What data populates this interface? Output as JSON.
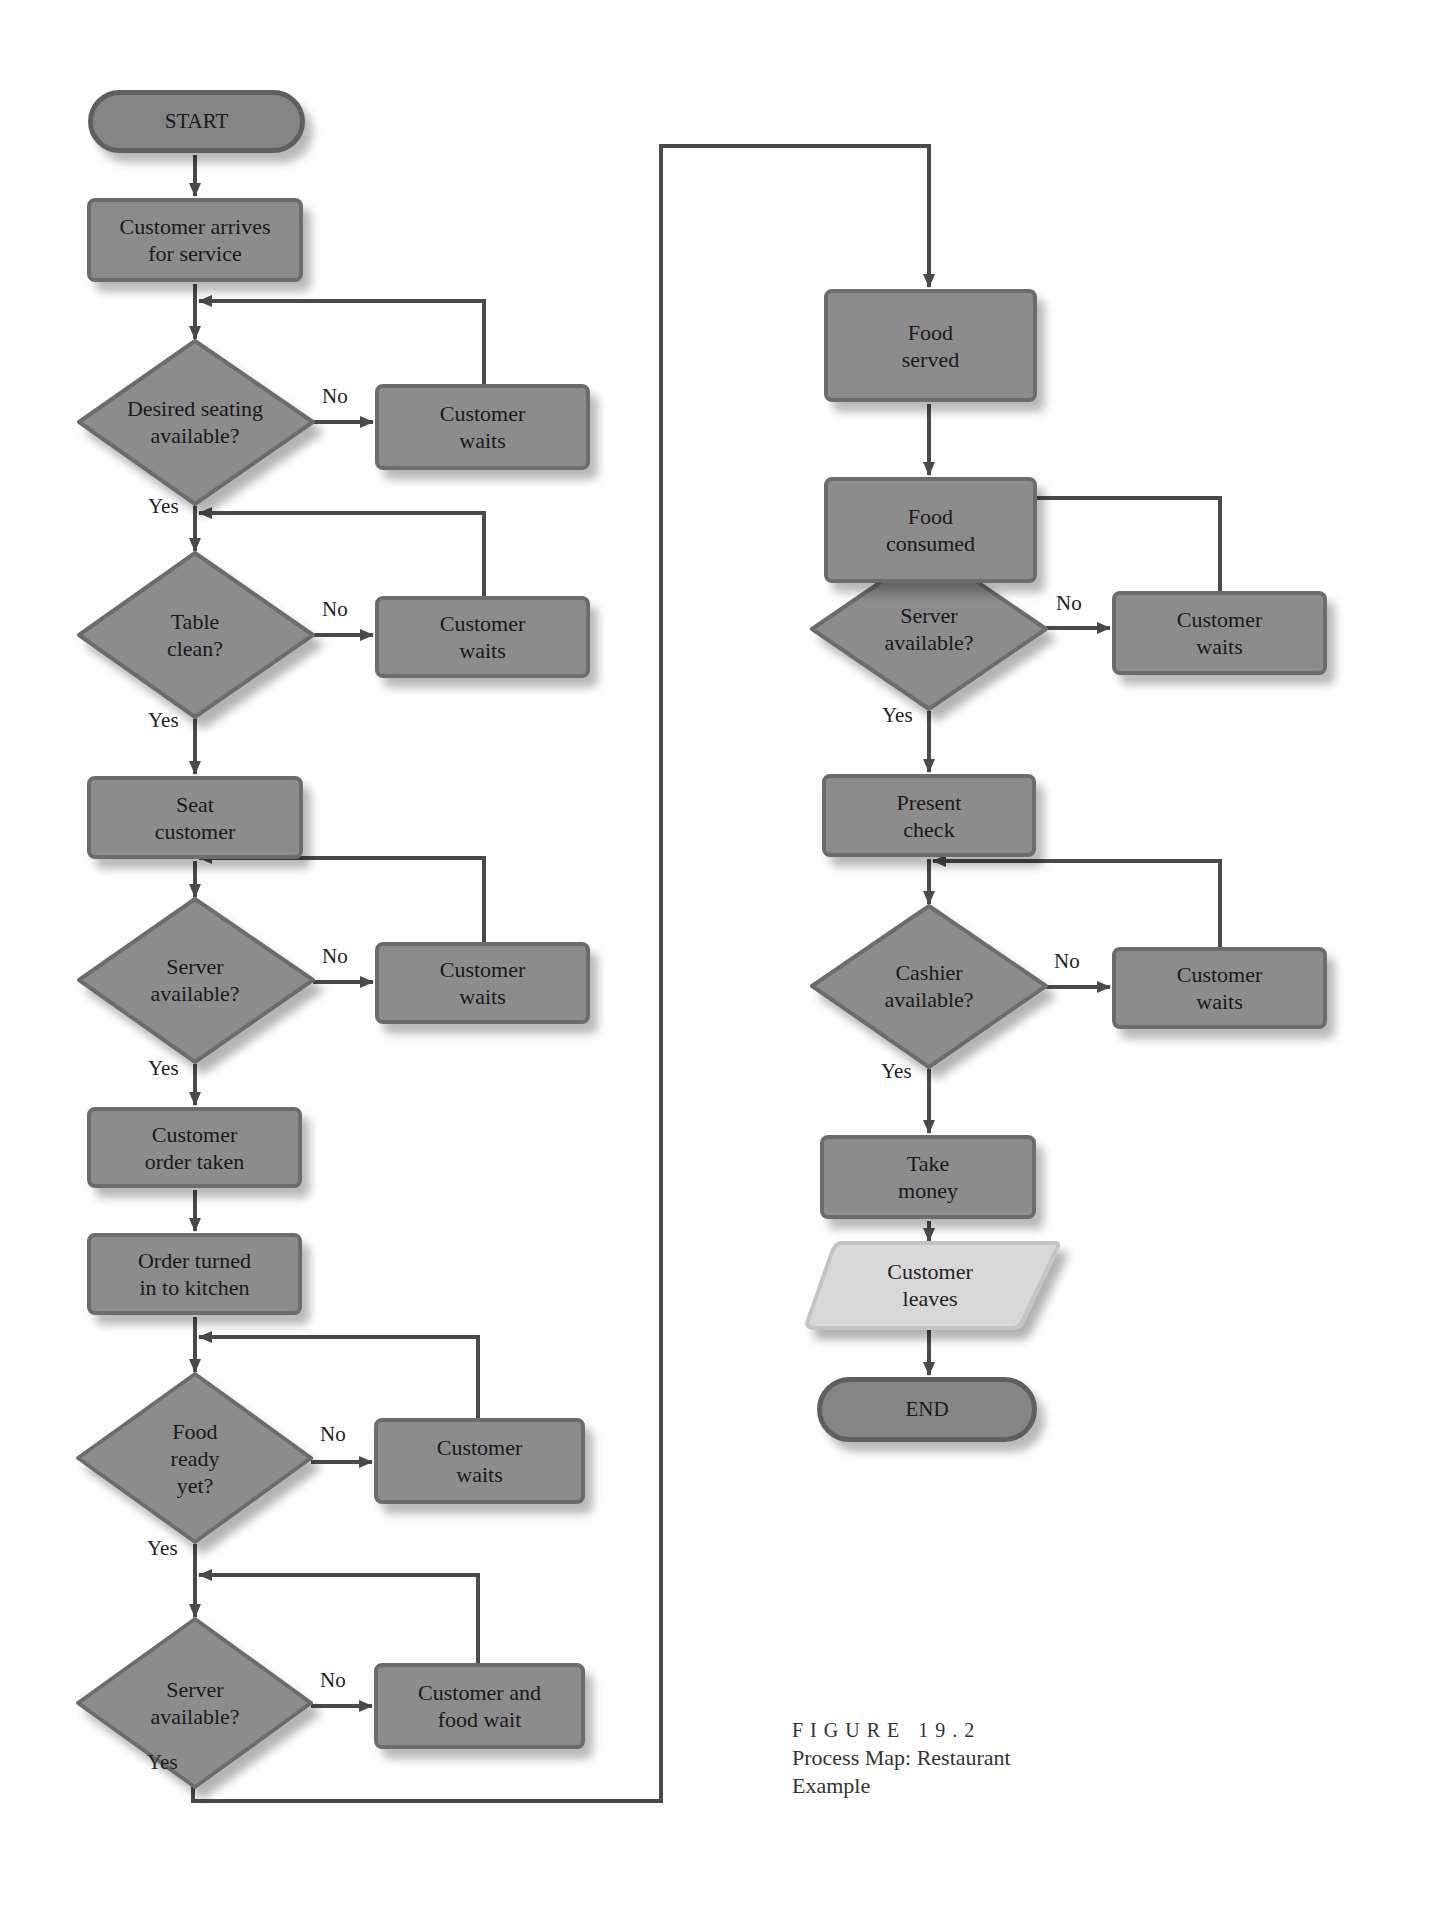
{
  "colors": {
    "process_fill": "#8c8c8c",
    "process_border": "#6c6c6c",
    "terminal_fill": "#858585",
    "io_fill": "#d8d8d8",
    "connector": "#4a4a4a"
  },
  "diagram": {
    "start": "START",
    "end": "END",
    "left_column": {
      "arrive": "Customer arrives\nfor service",
      "seating_q": "Desired seating\navailable?",
      "seating_wait": "Customer\nwaits",
      "table_q": "Table\nclean?",
      "table_wait": "Customer\nwaits",
      "seat": "Seat\ncustomer",
      "server_q1": "Server\navailable?",
      "server_wait1": "Customer\nwaits",
      "order_taken": "Customer\norder taken",
      "order_kitchen": "Order turned\nin to kitchen",
      "food_q": "Food\nready\nyet?",
      "food_wait": "Customer\nwaits",
      "server_q2": "Server\navailable?",
      "server_wait2": "Customer and\nfood wait"
    },
    "right_column": {
      "food_served": "Food\nserved",
      "food_consumed": "Food\nconsumed",
      "server_q3": "Server\navailable?",
      "server_wait3": "Customer\nwaits",
      "present_check": "Present\ncheck",
      "cashier_q": "Cashier\navailable?",
      "cashier_wait": "Customer\nwaits",
      "take_money": "Take\nmoney",
      "leaves": "Customer\nleaves"
    },
    "labels": {
      "yes": "Yes",
      "no": "No"
    }
  },
  "caption": {
    "figure": "FIGURE 19.2",
    "title_line1": "Process Map: Restaurant",
    "title_line2": "Example"
  }
}
